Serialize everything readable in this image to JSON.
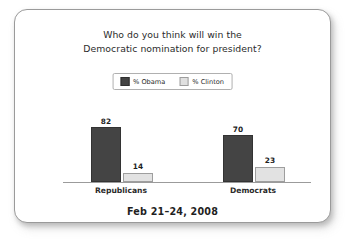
{
  "card": {
    "title_line_1": "Who do you think will win the",
    "title_line_2": "Democratic nomination for president?",
    "footer": "Feb 21–24, 2008"
  },
  "legend": {
    "items": [
      {
        "label": "% Obama",
        "color": "#444444"
      },
      {
        "label": "% Clinton",
        "color": "#e2e2e2"
      }
    ]
  },
  "chart_data": {
    "type": "bar",
    "title": "Who do you think will win the Democratic nomination for president?",
    "subtitle": "Feb 21–24, 2008",
    "categories": [
      "Republicans",
      "Democrats"
    ],
    "series": [
      {
        "name": "% Obama",
        "values": [
          82,
          70
        ],
        "color": "#444444"
      },
      {
        "name": "% Clinton",
        "values": [
          14,
          23
        ],
        "color": "#e2e2e2"
      }
    ],
    "xlabel": "",
    "ylabel": "",
    "ylim": [
      0,
      100
    ],
    "grid": false,
    "legend_position": "top-center",
    "value_labels": true
  }
}
